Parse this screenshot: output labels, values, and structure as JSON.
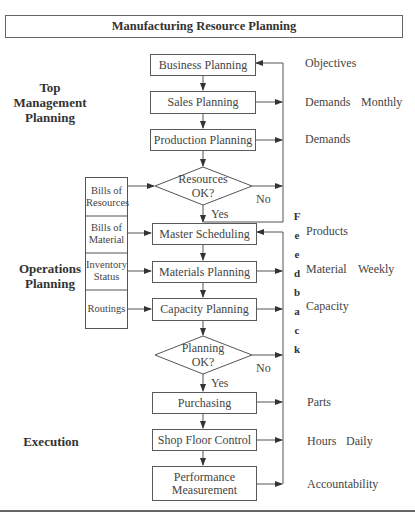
{
  "title": "Manufacturing Resource Planning",
  "sections": {
    "top": "Top Management Planning",
    "top_lines": [
      "Top",
      "Management",
      "Planning"
    ],
    "operations_lines": [
      "Operations",
      "Planning"
    ],
    "execution": "Execution"
  },
  "flow": {
    "business": "Business Planning",
    "sales": "Sales Planning",
    "production": "Production Planning",
    "resources_q": [
      "Resources",
      "OK?"
    ],
    "master": "Master Scheduling",
    "materials": "Materials Planning",
    "capacity": "Capacity Planning",
    "planning_q": [
      "Planning",
      "OK?"
    ],
    "purchasing": "Purchasing",
    "shop_floor": "Shop Floor Control",
    "performance": [
      "Performance",
      "Measurement"
    ]
  },
  "inputs": {
    "bills_resources": [
      "Bills of",
      "Resources"
    ],
    "bills_material": [
      "Bills of",
      "Material"
    ],
    "inventory": [
      "Inventory",
      "Status"
    ],
    "routings": "Routings"
  },
  "branch_labels": {
    "no1": "No",
    "yes1": "Yes",
    "no2": "No",
    "yes2": "Yes"
  },
  "feedback_letters": [
    "F",
    "e",
    "e",
    "d",
    "b",
    "a",
    "c",
    "k"
  ],
  "outputs": {
    "objectives": "Objectives",
    "demands1": "Demands",
    "monthly": "Monthly",
    "demands2": "Demands",
    "products": "Products",
    "material": "Material",
    "weekly": "Weekly",
    "capacity": "Capacity",
    "parts": "Parts",
    "hours": "Hours",
    "daily": "Daily",
    "accountability": "Accountability"
  }
}
